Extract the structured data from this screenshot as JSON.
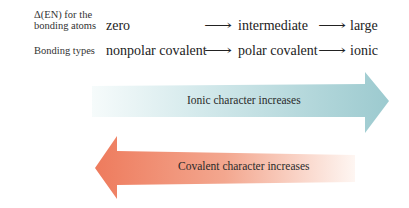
{
  "rows": {
    "delta_en": {
      "label_line1": "Δ(EN) for the",
      "label_line2": "bonding atoms",
      "values": [
        "zero",
        "intermediate",
        "large"
      ]
    },
    "bonding_types": {
      "label": "Bonding types",
      "values": [
        "nonpolar covalent",
        "polar covalent",
        "ionic"
      ]
    },
    "connector": "⟶"
  },
  "arrows": {
    "ionic": {
      "text": "Ionic character increases",
      "direction": "right",
      "color_start": "#f4fafa",
      "color_end": "#9fcbd0"
    },
    "covalent": {
      "text": "Covalent character increases",
      "direction": "left",
      "color_start": "#ee7f62",
      "color_end": "#fdf1ec"
    }
  }
}
